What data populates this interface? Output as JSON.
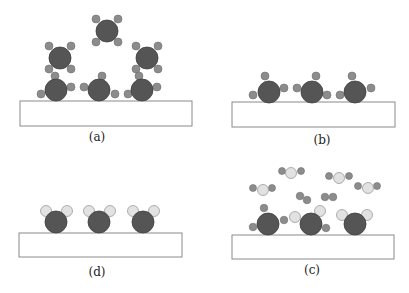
{
  "figure": {
    "panels": [
      {
        "id": "a",
        "label": "(a)",
        "description": "Precursor molecules (central atom with four ligands) approaching and adsorbing on substrate"
      },
      {
        "id": "b",
        "label": "(b)",
        "description": "Adsorbed molecules with three remaining ligands on substrate"
      },
      {
        "id": "c",
        "label": "(c)",
        "description": "Co-reactant molecules arriving and by-products leaving; partial ligand exchange on surface"
      },
      {
        "id": "d",
        "label": "(d)",
        "description": "Surface atoms each terminated with two light-colored groups"
      }
    ],
    "colors": {
      "central_atom": "#555555",
      "ligand": "#8c8c8c",
      "light_group": "#e2e2e2",
      "substrate_border": "#8a8a8a"
    }
  }
}
